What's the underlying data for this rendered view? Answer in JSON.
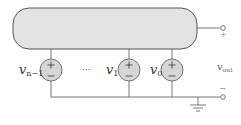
{
  "diagram": {
    "colors": {
      "block_fill": "#e3e3e3",
      "source_fill": "#d6d6d6",
      "stroke": "#555555",
      "text": "#333333"
    },
    "sources": [
      {
        "label_main": "v",
        "label_sub": "n−1",
        "plus": "+",
        "minus": "−"
      },
      {
        "label_main": "v",
        "label_sub": "1",
        "plus": "+",
        "minus": "−"
      },
      {
        "label_main": "v",
        "label_sub": "0",
        "plus": "+",
        "minus": "−"
      }
    ],
    "ellipsis": "···",
    "output": {
      "label_main": "v",
      "label_sub": "out",
      "plus": "+",
      "minus": "−"
    },
    "ground": "ground"
  }
}
